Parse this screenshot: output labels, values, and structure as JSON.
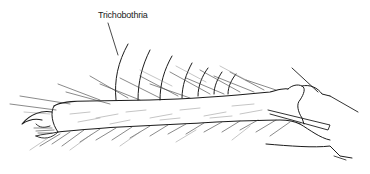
{
  "figure": {
    "labels": {
      "trichobothria": "Trichobothria"
    },
    "colors": {
      "background": "#ffffff",
      "ink": "#1c1c1c"
    }
  }
}
